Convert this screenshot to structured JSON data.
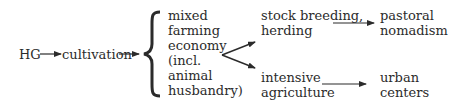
{
  "diagram": {
    "nodes": {
      "hg": "HG",
      "cultivation": "cultivation",
      "mixed": [
        "mixed",
        "farming",
        "economy",
        "(incl.",
        "animal",
        "husbandry)"
      ],
      "stock": [
        "stock breeding,",
        "herding"
      ],
      "intensive": [
        "intensive",
        "agriculture"
      ],
      "pastoral": [
        "pastoral",
        "nomadism"
      ],
      "urban": [
        "urban",
        "centers"
      ]
    },
    "edges": [
      {
        "from": "HG",
        "to": "cultivation"
      },
      {
        "from": "cultivation",
        "to": "mixed farming economy (incl. animal husbandry)"
      },
      {
        "from": "mixed farming economy (incl. animal husbandry)",
        "to": "stock breeding, herding"
      },
      {
        "from": "mixed farming economy (incl. animal husbandry)",
        "to": "intensive agriculture"
      },
      {
        "from": "stock breeding, herding",
        "to": "pastoral nomadism"
      },
      {
        "from": "intensive agriculture",
        "to": "urban centers"
      }
    ],
    "colors": {
      "text": "#2b2b2b",
      "arrow": "#2b2b2b",
      "background": "#ffffff"
    }
  }
}
